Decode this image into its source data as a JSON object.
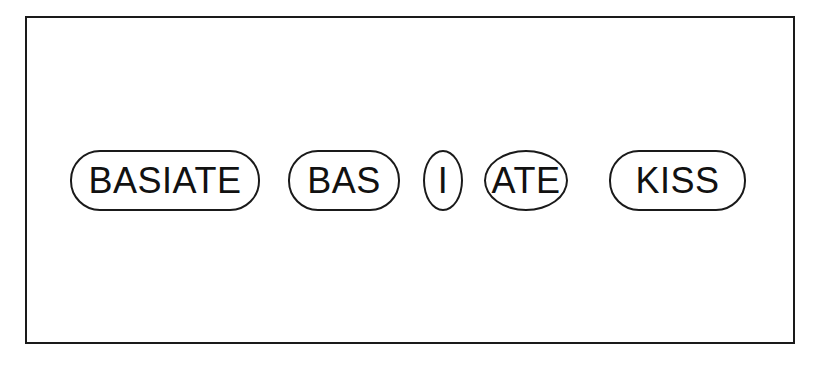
{
  "diagram": {
    "title": "",
    "tokens": [
      {
        "label": "BASIATE",
        "shape": "pill"
      },
      {
        "label": "BAS",
        "shape": "pill"
      },
      {
        "label": "I",
        "shape": "oval"
      },
      {
        "label": "ATE",
        "shape": "oval"
      },
      {
        "label": "KISS",
        "shape": "pill"
      }
    ],
    "colors": {
      "stroke": "#1a1a1a",
      "background": "#ffffff",
      "text": "#111111"
    }
  }
}
